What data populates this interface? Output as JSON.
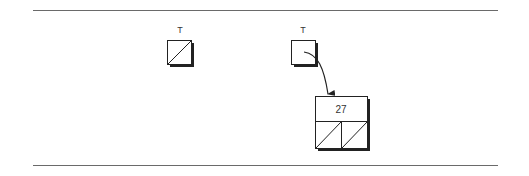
{
  "diagram": {
    "type": "linked-list-insertion",
    "before": {
      "pointer_label": "T",
      "pointer_value": "null"
    },
    "after": {
      "pointer_label": "T",
      "node": {
        "value": "27",
        "left": "null",
        "right": "null"
      }
    }
  },
  "colors": {
    "line": "#6a6a6a",
    "stroke": "#222222",
    "shadow": "#222222",
    "background": "#ffffff"
  }
}
